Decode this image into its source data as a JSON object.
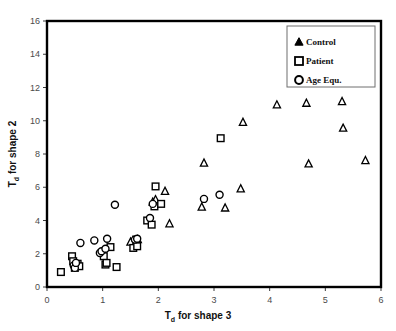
{
  "chart_data": {
    "type": "scatter",
    "title": "",
    "xlabel": "T_d for shape 3",
    "xlabel_main": "T",
    "xlabel_sub": "d",
    "xlabel_rest": " for shape 3",
    "ylabel": "T_d for shape 2",
    "ylabel_main": "T",
    "ylabel_sub": "d",
    "ylabel_rest": " for shape 2",
    "xlim": [
      0,
      6
    ],
    "ylim": [
      0,
      16
    ],
    "xticks": [
      0,
      1,
      2,
      3,
      4,
      5,
      6
    ],
    "yticks": [
      0,
      2,
      4,
      6,
      8,
      10,
      12,
      14,
      16
    ],
    "xtick_labels": [
      "0",
      "1",
      "2",
      "3",
      "4",
      "5",
      "6"
    ],
    "ytick_labels": [
      "0",
      "2",
      "4",
      "6",
      "8",
      "10",
      "12",
      "14",
      "16"
    ],
    "grid": false,
    "legend_position": "top-right",
    "series": [
      {
        "name": "Control",
        "marker": "triangle",
        "points": [
          [
            1.5,
            2.7
          ],
          [
            1.63,
            2.85
          ],
          [
            1.9,
            5.1
          ],
          [
            1.95,
            5.25
          ],
          [
            2.12,
            5.75
          ],
          [
            2.2,
            3.8
          ],
          [
            2.78,
            4.8
          ],
          [
            2.82,
            7.45
          ],
          [
            3.2,
            4.75
          ],
          [
            3.48,
            5.9
          ],
          [
            3.52,
            9.9
          ],
          [
            4.13,
            10.95
          ],
          [
            4.5,
            14.5
          ],
          [
            4.66,
            11.05
          ],
          [
            4.7,
            7.4
          ],
          [
            5.3,
            11.15
          ],
          [
            5.32,
            9.55
          ],
          [
            5.72,
            7.6
          ]
        ]
      },
      {
        "name": "Patient",
        "marker": "square",
        "points": [
          [
            0.25,
            0.9
          ],
          [
            0.45,
            1.85
          ],
          [
            0.47,
            1.55
          ],
          [
            0.5,
            1.15
          ],
          [
            0.55,
            1.4
          ],
          [
            0.58,
            1.25
          ],
          [
            1.02,
            1.85
          ],
          [
            1.05,
            1.35
          ],
          [
            1.07,
            1.45
          ],
          [
            1.14,
            2.4
          ],
          [
            1.25,
            1.2
          ],
          [
            1.55,
            2.35
          ],
          [
            1.6,
            2.85
          ],
          [
            1.62,
            2.45
          ],
          [
            1.8,
            4.0
          ],
          [
            1.88,
            3.75
          ],
          [
            1.93,
            4.85
          ],
          [
            1.95,
            6.05
          ],
          [
            2.05,
            5.0
          ],
          [
            3.12,
            8.95
          ]
        ]
      },
      {
        "name": "Age Equ.",
        "marker": "circle",
        "points": [
          [
            0.48,
            1.3
          ],
          [
            0.5,
            1.15
          ],
          [
            0.52,
            1.45
          ],
          [
            0.6,
            2.65
          ],
          [
            0.85,
            2.8
          ],
          [
            0.95,
            2.05
          ],
          [
            0.98,
            2.15
          ],
          [
            1.05,
            2.3
          ],
          [
            1.08,
            2.9
          ],
          [
            1.22,
            4.95
          ],
          [
            1.58,
            2.85
          ],
          [
            1.62,
            2.9
          ],
          [
            1.85,
            4.15
          ],
          [
            1.9,
            5.0
          ],
          [
            2.82,
            5.3
          ],
          [
            3.1,
            5.55
          ]
        ]
      }
    ],
    "legend_entries": [
      {
        "label": "Control",
        "marker": "triangle"
      },
      {
        "label": "Patient",
        "marker": "square"
      },
      {
        "label": "Age Equ.",
        "marker": "circle"
      }
    ]
  }
}
